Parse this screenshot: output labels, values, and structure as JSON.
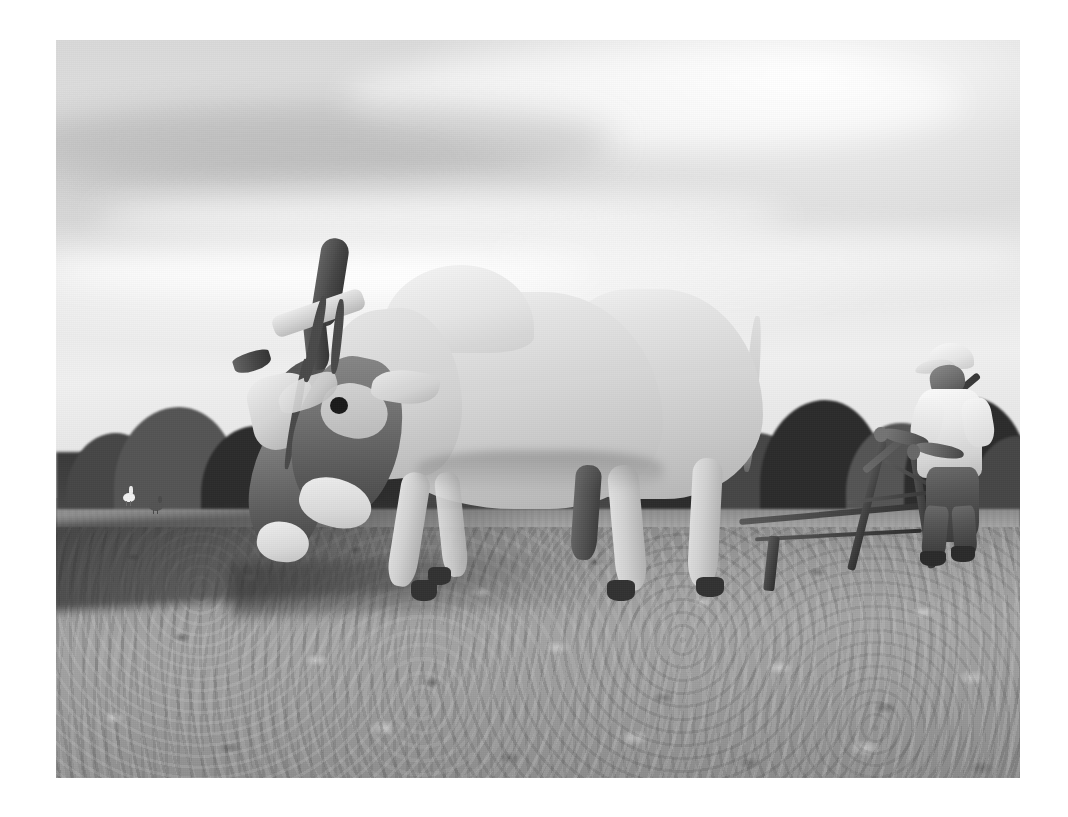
{
  "page": {
    "background_color": "#ffffff",
    "width": 1068,
    "height": 817
  },
  "photograph": {
    "title": "Pair of oxen pulling a wooden plow guided by a farmer in a freshly tilled field",
    "medium": "black-and-white photograph",
    "tone": "monochrome grayscale",
    "frame": {
      "left": 56,
      "top": 40,
      "width": 964,
      "height": 738
    },
    "colors": {
      "sky_light": "#efefef",
      "sky_mid": "#d8d8d8",
      "treeline_dark": "#2e2e2e",
      "grass_strip": "#9a9a9a",
      "soil_light": "#a3a3a3",
      "soil_shadow": "#3c3c3c",
      "ox_pale_hide": "#e6e3de",
      "ox_dark_head": "#55514d",
      "shirt_white": "#f7f5f2",
      "trousers_dark": "#55504b"
    },
    "scene": {
      "sky": {
        "label": "overcast hazy sky",
        "description": "bright white and pale gray clouds in soft horizontal bands filling the upper two thirds"
      },
      "treeline": {
        "label": "background tree line",
        "description": "dense dark band of tropical trees across the horizon"
      },
      "grass": {
        "label": "grass strip",
        "description": "pale untilled grass strip between the tree line and the plowed soil"
      },
      "field": {
        "label": "plowed field",
        "description": "rough clod-strewn tilled earth filling the lower third with a dark furrow behind the oxen"
      }
    },
    "subjects": [
      {
        "id": "lead-ox",
        "label": "Lead ox",
        "description": "pale cream zebu ox with pronounced shoulder hump, head lowered, walking left"
      },
      {
        "id": "second-ox",
        "label": "Second ox",
        "description": "darker-headed ox yoked alongside, partly hidden behind the lead animal"
      },
      {
        "id": "yoke",
        "label": "Wooden head yoke",
        "description": "light wooden bar lashed across both animals' horns with pale straps"
      },
      {
        "id": "farmer",
        "label": "Farmer",
        "description": "man in white cap and white short-sleeved shirt with dark trousers, gripping the plow handles"
      },
      {
        "id": "plow",
        "label": "Wooden ard plow",
        "description": "traditional wooden plow with a long beam, curved handles and a single share cutting the soil"
      },
      {
        "id": "goad",
        "label": "Goad stick",
        "description": "long thin stick held in the farmer's left hand angling up and forward over the oxen"
      },
      {
        "id": "birds",
        "label": "Field birds",
        "description": "a white egret and a darker bird foraging in the field at the left"
      }
    ]
  }
}
